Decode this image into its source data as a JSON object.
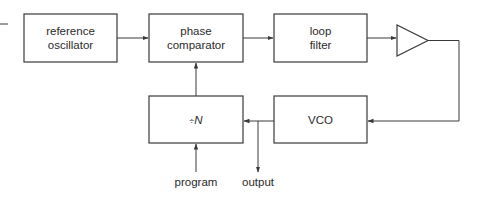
{
  "diagram": {
    "type": "block-diagram",
    "colors": {
      "line": "#3a3a3a",
      "text": "#2a2a2a",
      "background": "#ffffff"
    },
    "blocks": {
      "reference_oscillator": {
        "line1": "reference",
        "line2": "oscillator"
      },
      "phase_comparator": {
        "line1": "phase",
        "line2": "comparator"
      },
      "loop_filter": {
        "line1": "loop",
        "line2": "filter"
      },
      "amplifier": {
        "shape": "triangle"
      },
      "divider": {
        "prefix": "÷",
        "symbol": "N"
      },
      "vco": {
        "label": "VCO"
      }
    },
    "signals": {
      "program": "program",
      "output": "output"
    },
    "connections": [
      [
        "reference oscillator",
        "phase comparator"
      ],
      [
        "phase comparator",
        "loop filter"
      ],
      [
        "loop filter",
        "amplifier"
      ],
      [
        "amplifier",
        "VCO"
      ],
      [
        "VCO",
        "÷N"
      ],
      [
        "VCO",
        "output"
      ],
      [
        "÷N",
        "phase comparator"
      ],
      [
        "program",
        "÷N"
      ]
    ]
  }
}
